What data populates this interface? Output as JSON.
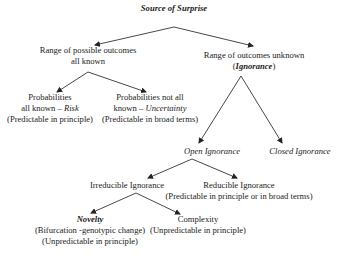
{
  "diagram": {
    "root": {
      "title": "Source of Surprise"
    },
    "known": {
      "line1": "Range of possible outcomes",
      "line2": "all known"
    },
    "unknown": {
      "line1": "Range of outcomes unknown",
      "line2_open": "(",
      "line2_em": "Ignorance",
      "line2_close": ")"
    },
    "risk": {
      "line1": "Probabilities",
      "line2_prefix": "all known – ",
      "line2_em": "Risk",
      "line3": "(Predictable in principle)"
    },
    "uncertainty": {
      "line1": "Probabilities not all",
      "line2_prefix": "known – ",
      "line2_em": "Uncertainty",
      "line3": "(Predictable in broad terms)"
    },
    "open_ignorance": {
      "label": "Open Ignorance"
    },
    "closed_ignorance": {
      "label": "Closed Ignorance"
    },
    "irreducible": {
      "label": "Irreducible Ignorance"
    },
    "reducible": {
      "line1": "Reducible Ignorance",
      "line2": "(Predictable in principle or in broad terms)"
    },
    "novelty": {
      "line1": "Novelty",
      "line2": "(Bifurcation  -genotypic change)",
      "line3": "(Unpredictable in principle)"
    },
    "complexity": {
      "line1": "Complexity",
      "line2": "(Unpredictable in principle)"
    }
  },
  "colors": {
    "line": "#333333",
    "text": "#222222",
    "background": "#ffffff"
  }
}
